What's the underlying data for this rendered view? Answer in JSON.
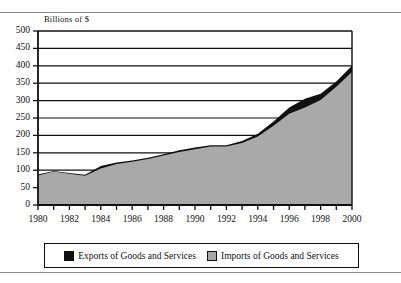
{
  "figure": {
    "axis_title": "Billions of $",
    "colors": {
      "exports_fill": "#101010",
      "imports_fill": "#a9a9a9",
      "axis": "#101010",
      "gridline": "#101010",
      "plot_background": "#ffffff",
      "rule": "#8a8a8a"
    }
  },
  "legend": {
    "entries": [
      {
        "label": "Exports of Goods and Services",
        "swatch": "exports-swatch",
        "color": "#101010"
      },
      {
        "label": "Imports of Goods and Services",
        "swatch": "imports-swatch",
        "color": "#a9a9a9"
      }
    ]
  },
  "chart_data": {
    "type": "area",
    "title": "",
    "subtitle": "",
    "xlabel": "",
    "ylabel": "Billions of $",
    "xlim": [
      1980,
      2000
    ],
    "ylim": [
      0,
      500
    ],
    "yticks": [
      0,
      50,
      100,
      150,
      200,
      250,
      300,
      350,
      400,
      450,
      500
    ],
    "ytick_labels": [
      "0",
      "50",
      "100",
      "150",
      "200",
      "250",
      "300",
      "350",
      "400",
      "450",
      "500"
    ],
    "xticks": [
      1980,
      1981,
      1982,
      1983,
      1984,
      1985,
      1986,
      1987,
      1988,
      1989,
      1990,
      1991,
      1992,
      1993,
      1994,
      1995,
      1996,
      1997,
      1998,
      1999,
      2000
    ],
    "xtick_labels": [
      "1980",
      "",
      "1982",
      "",
      "1984",
      "",
      "1986",
      "",
      "1988",
      "",
      "1990",
      "",
      "1992",
      "",
      "1994",
      "",
      "1996",
      "",
      "1998",
      "",
      "2000"
    ],
    "xtick_labels_shown": [
      "1980",
      "1982",
      "1984",
      "1986",
      "1988",
      "1990",
      "1992",
      "1994",
      "1996",
      "1998",
      "2000"
    ],
    "grid": "horizontal",
    "legend_position": "below",
    "x": [
      1980,
      1981,
      1982,
      1983,
      1984,
      1985,
      1986,
      1987,
      1988,
      1989,
      1990,
      1991,
      1992,
      1993,
      1994,
      1995,
      1996,
      1997,
      1998,
      1999,
      2000
    ],
    "series": [
      {
        "name": "Exports of Goods and Services",
        "color": "#101010",
        "values": [
          88,
          98,
          92,
          87,
          112,
          122,
          128,
          136,
          146,
          157,
          165,
          172,
          172,
          184,
          205,
          240,
          280,
          305,
          320,
          355,
          400
        ]
      },
      {
        "name": "Imports of Goods and Services",
        "color": "#a9a9a9",
        "values": [
          85,
          96,
          90,
          84,
          105,
          118,
          124,
          132,
          142,
          152,
          160,
          168,
          168,
          178,
          197,
          228,
          262,
          280,
          302,
          340,
          382
        ]
      }
    ],
    "series_stacking": "overlaid"
  }
}
